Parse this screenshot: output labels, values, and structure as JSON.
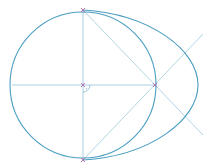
{
  "diagram": {
    "type": "geometric-construction",
    "colors": {
      "curve": "#4a9ec0",
      "construction_line": "#9fcbe0",
      "point_marker": "#b06aa8",
      "background": "#ffffff"
    },
    "points": {
      "center": {
        "x": 83,
        "y": 85
      },
      "top": {
        "x": 83,
        "y": 10
      },
      "bottom": {
        "x": 83,
        "y": 160
      },
      "right": {
        "x": 155,
        "y": 85
      }
    },
    "circle": {
      "cx": 83,
      "cy": 85,
      "r": 73
    },
    "egg_tip_x": 198,
    "right_angle_marker": true
  }
}
